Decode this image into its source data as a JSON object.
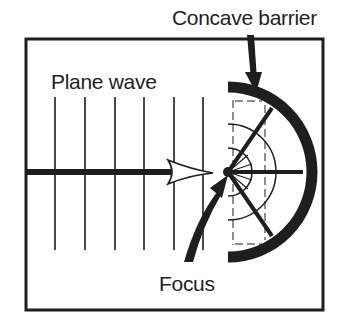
{
  "diagram": {
    "labels": {
      "concave_barrier": "Concave barrier",
      "plane_wave": "Plane wave",
      "focus": "Focus"
    },
    "colors": {
      "ink": "#1e1e1e",
      "background": "#ffffff"
    },
    "elements": {
      "frame": "rectangular border",
      "wavefronts": "6 vertical parallel lines (plane wave)",
      "incident_ray": "thick horizontal arrow pointing right toward focus",
      "barrier": "thick semicircular concave reflector opening left",
      "reflected_rays": "rays from barrier converging to focus",
      "reflected_wavefronts": "concentric arcs around focus",
      "focus_point": "black dot at center of curvature",
      "focus_pointer": "curved arrow from Focus label to focus point",
      "barrier_pointer": "downward arrow from Concave barrier label to barrier"
    }
  }
}
